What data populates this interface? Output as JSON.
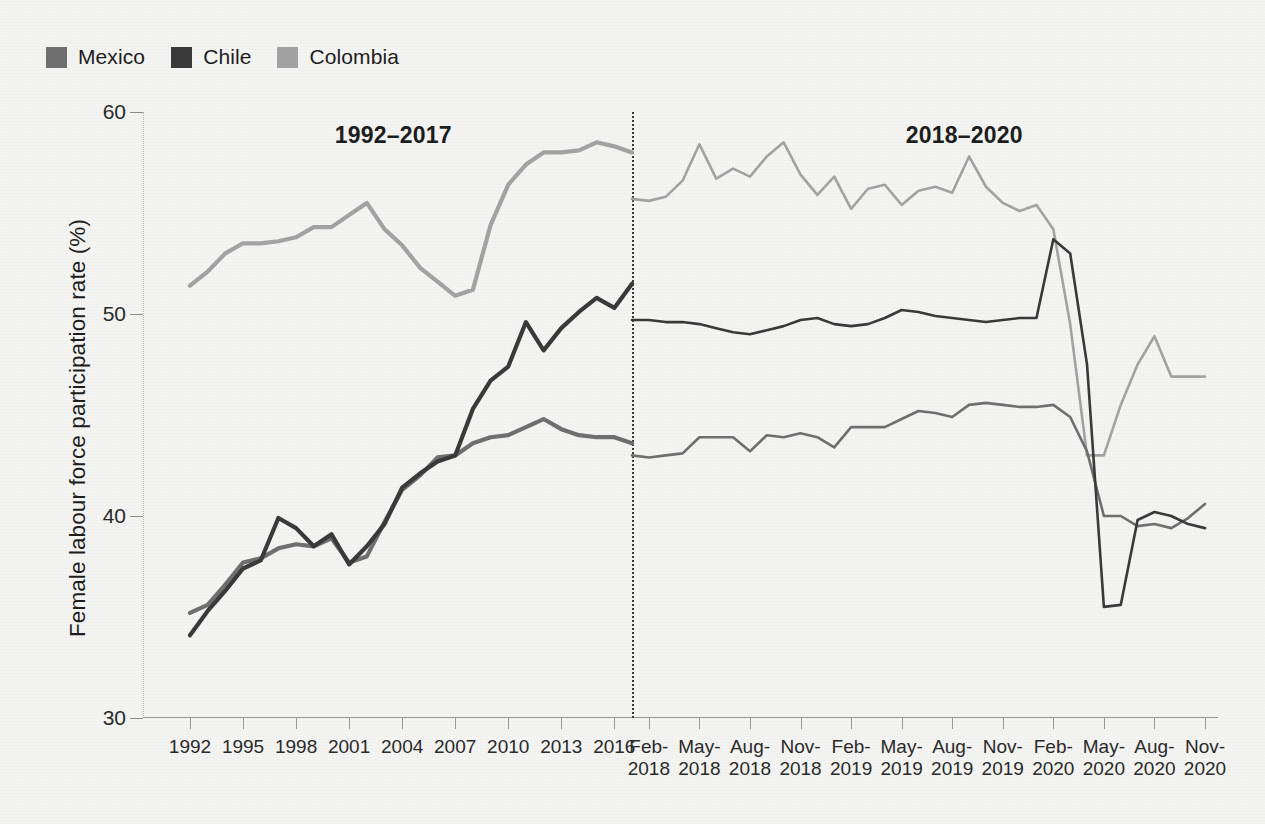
{
  "legend": {
    "items": [
      {
        "label": "Mexico",
        "color": "#6f6f6f",
        "key": "mexico"
      },
      {
        "label": "Chile",
        "color": "#3a3a3a",
        "key": "chile"
      },
      {
        "label": "Colombia",
        "color": "#a3a3a3",
        "key": "colombia"
      }
    ]
  },
  "panels": {
    "left_title": "1992–2017",
    "right_title": "2018–2020"
  },
  "chart_data": {
    "type": "line",
    "title": "",
    "subtitle": "",
    "xlabel": "",
    "ylabel": "Female labour force participation rate (%)",
    "ylim": [
      30,
      60
    ],
    "y_ticks": [
      30,
      40,
      50,
      60
    ],
    "grid": false,
    "legend_position": "top-left",
    "annotations": [
      "1992–2017",
      "2018–2020"
    ],
    "panel_split_note": "Dotted vertical divider between annual panel (1992–2017) and monthly panel (2018–2020)",
    "left_panel": {
      "x_tick_labels": [
        "1992",
        "1995",
        "1998",
        "2001",
        "2004",
        "2007",
        "2010",
        "2013",
        "2016"
      ],
      "x": [
        1992,
        1993,
        1994,
        1995,
        1996,
        1997,
        1998,
        1999,
        2000,
        2001,
        2002,
        2003,
        2004,
        2005,
        2006,
        2007,
        2008,
        2009,
        2010,
        2011,
        2012,
        2013,
        2014,
        2015,
        2016,
        2017
      ],
      "series": [
        {
          "name": "Mexico",
          "color": "#6f6f6f",
          "values": [
            35.2,
            35.6,
            36.6,
            37.7,
            37.9,
            38.4,
            38.6,
            38.5,
            38.9,
            37.7,
            38.0,
            39.7,
            41.3,
            42.0,
            42.9,
            43.0,
            43.6,
            43.9,
            44.0,
            44.4,
            44.8,
            44.3,
            44.0,
            43.9,
            43.9,
            43.6
          ]
        },
        {
          "name": "Chile",
          "color": "#3a3a3a",
          "values": [
            34.1,
            35.3,
            36.3,
            37.4,
            37.8,
            39.9,
            39.4,
            38.5,
            39.1,
            37.6,
            38.5,
            39.6,
            41.4,
            42.1,
            42.7,
            43.0,
            45.3,
            46.7,
            47.4,
            49.6,
            48.2,
            49.3,
            50.1,
            50.8,
            50.3,
            51.5
          ]
        },
        {
          "name": "Colombia",
          "color": "#a3a3a3",
          "values": [
            51.4,
            52.1,
            53.0,
            53.5,
            53.5,
            53.6,
            53.8,
            54.3,
            54.3,
            54.9,
            55.5,
            54.2,
            53.4,
            52.3,
            51.6,
            50.9,
            51.2,
            54.4,
            56.4,
            57.4,
            58.0,
            58.0,
            58.1,
            58.5,
            58.3,
            58.0
          ]
        }
      ]
    },
    "right_panel": {
      "x_tick_labels": [
        {
          "month": "Feb-",
          "year": "2018"
        },
        {
          "month": "May-",
          "year": "2018"
        },
        {
          "month": "Aug-",
          "year": "2018"
        },
        {
          "month": "Nov-",
          "year": "2018"
        },
        {
          "month": "Feb-",
          "year": "2019"
        },
        {
          "month": "May-",
          "year": "2019"
        },
        {
          "month": "Aug-",
          "year": "2019"
        },
        {
          "month": "Nov-",
          "year": "2019"
        },
        {
          "month": "Feb-",
          "year": "2020"
        },
        {
          "month": "May-",
          "year": "2020"
        },
        {
          "month": "Aug-",
          "year": "2020"
        },
        {
          "month": "Nov-",
          "year": "2020"
        }
      ],
      "x": [
        "Jan-2018",
        "Feb-2018",
        "Mar-2018",
        "Apr-2018",
        "May-2018",
        "Jun-2018",
        "Jul-2018",
        "Aug-2018",
        "Sep-2018",
        "Oct-2018",
        "Nov-2018",
        "Dec-2018",
        "Jan-2019",
        "Feb-2019",
        "Mar-2019",
        "Apr-2019",
        "May-2019",
        "Jun-2019",
        "Jul-2019",
        "Aug-2019",
        "Sep-2019",
        "Oct-2019",
        "Nov-2019",
        "Dec-2019",
        "Jan-2020",
        "Feb-2020",
        "Mar-2020",
        "Apr-2020",
        "May-2020",
        "Jun-2020",
        "Jul-2020",
        "Aug-2020",
        "Sep-2020",
        "Oct-2020",
        "Nov-2020"
      ],
      "series": [
        {
          "name": "Mexico",
          "color": "#6f6f6f",
          "values": [
            43.0,
            42.9,
            43.0,
            43.1,
            43.9,
            43.9,
            43.9,
            43.2,
            44.0,
            43.9,
            44.1,
            43.9,
            43.4,
            44.4,
            44.4,
            44.4,
            44.8,
            45.2,
            45.1,
            44.9,
            45.5,
            45.6,
            45.5,
            45.4,
            45.4,
            45.5,
            44.9,
            43.2,
            40.0,
            40.0,
            39.5,
            39.6,
            39.4,
            39.9,
            40.6
          ]
        },
        {
          "name": "Chile",
          "color": "#3a3a3a",
          "values": [
            49.7,
            49.7,
            49.6,
            49.6,
            49.5,
            49.3,
            49.1,
            49.0,
            49.2,
            49.4,
            49.7,
            49.8,
            49.5,
            49.4,
            49.5,
            49.8,
            50.2,
            50.1,
            49.9,
            49.8,
            49.7,
            49.6,
            49.7,
            49.8,
            49.8,
            53.7,
            53.0,
            47.5,
            35.5,
            35.6,
            39.8,
            40.2,
            40.0,
            39.6,
            39.4
          ]
        },
        {
          "name": "Colombia",
          "color": "#a3a3a3",
          "values": [
            55.7,
            55.6,
            55.8,
            56.6,
            58.4,
            56.7,
            57.2,
            56.8,
            57.8,
            58.5,
            56.9,
            55.9,
            56.8,
            55.2,
            56.2,
            56.4,
            55.4,
            56.1,
            56.3,
            56.0,
            57.8,
            56.3,
            55.5,
            55.1,
            55.4,
            54.2,
            49.5,
            43.0,
            43.0,
            45.5,
            47.5,
            48.9,
            46.9,
            46.9,
            46.9
          ]
        }
      ]
    }
  }
}
